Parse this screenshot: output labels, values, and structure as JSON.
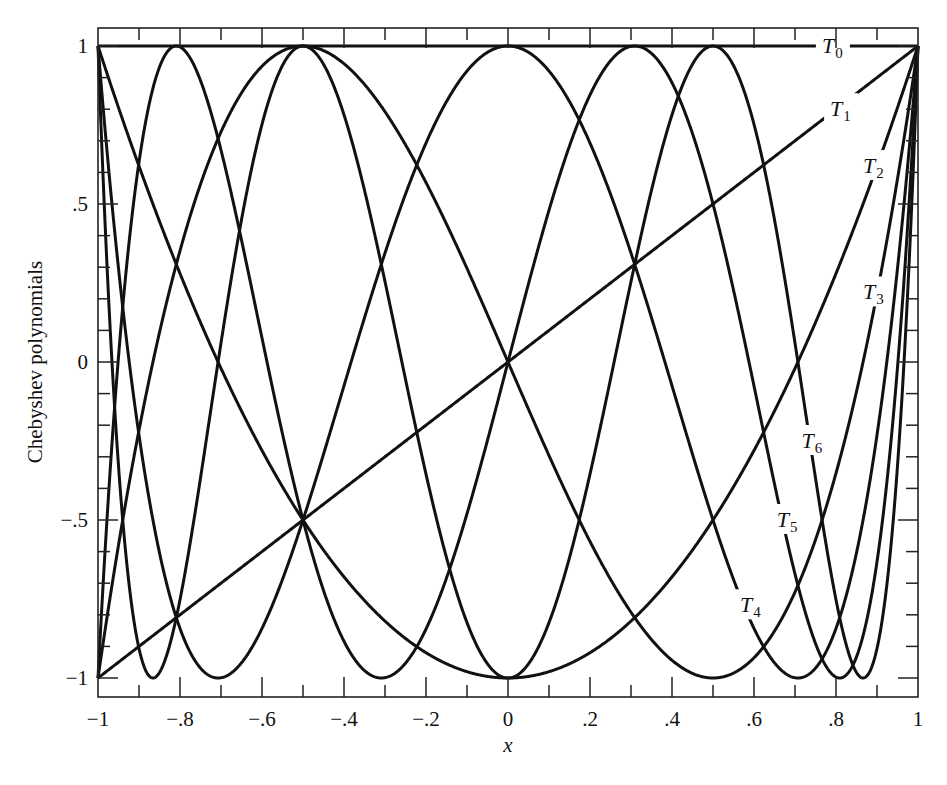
{
  "chart_data": {
    "type": "line",
    "title": "",
    "xlabel": "x",
    "ylabel": "Chebyshev polynomials",
    "xlim": [
      -1,
      1
    ],
    "ylim": [
      -1,
      1
    ],
    "grid": false,
    "legend": "inline labels",
    "x_ticks": [
      -1,
      -0.8,
      -0.6,
      -0.4,
      -0.2,
      0,
      0.2,
      0.4,
      0.6,
      0.8,
      1
    ],
    "x_tick_labels": [
      "−1",
      "−.8",
      "−.6",
      "−.4",
      "−.2",
      "0",
      ".2",
      ".4",
      ".6",
      ".8",
      "1"
    ],
    "y_ticks": [
      1,
      0.5,
      0,
      -0.5,
      -1
    ],
    "y_tick_labels": [
      "1",
      ".5",
      "0",
      "−.5",
      "−1"
    ],
    "series": [
      {
        "name": "T0",
        "order": 0,
        "formula": "cos(0*acos(x))",
        "values_at_x_ticks": [
          1,
          1,
          1,
          1,
          1,
          1,
          1,
          1,
          1,
          1,
          1
        ]
      },
      {
        "name": "T1",
        "order": 1,
        "formula": "x",
        "values_at_x_ticks": [
          -1,
          -0.8,
          -0.6,
          -0.4,
          -0.2,
          0,
          0.2,
          0.4,
          0.6,
          0.8,
          1
        ]
      },
      {
        "name": "T2",
        "order": 2,
        "formula": "2x^2-1",
        "values_at_x_ticks": [
          1,
          0.28,
          -0.28,
          -0.68,
          -0.92,
          -1,
          -0.92,
          -0.68,
          -0.28,
          0.28,
          1
        ]
      },
      {
        "name": "T3",
        "order": 3,
        "formula": "4x^3-3x",
        "values_at_x_ticks": [
          -1,
          0.352,
          0.936,
          0.944,
          0.568,
          0,
          -0.568,
          -0.944,
          -0.936,
          -0.352,
          1
        ]
      },
      {
        "name": "T4",
        "order": 4,
        "formula": "8x^4-8x^2+1",
        "values_at_x_ticks": [
          1,
          -0.843,
          -0.846,
          0.005,
          0.693,
          1,
          0.693,
          0.005,
          -0.846,
          -0.843,
          1
        ]
      },
      {
        "name": "T5",
        "order": 5,
        "formula": "16x^5-20x^3+5x",
        "values_at_x_ticks": [
          -1,
          -0.999,
          0.078,
          0.946,
          -0.845,
          0,
          0.845,
          -0.946,
          -0.078,
          0.999,
          1
        ]
      },
      {
        "name": "T6",
        "order": 6,
        "formula": "32x^6-48x^4+18x^2-1",
        "values_at_x_ticks": [
          1,
          0.443,
          0.939,
          -0.751,
          -0.126,
          -1,
          -0.126,
          -0.751,
          0.939,
          0.443,
          1
        ]
      }
    ],
    "labels": [
      {
        "series": "T0",
        "text": "T",
        "sub": "0",
        "x": 0.79,
        "y": 1.0
      },
      {
        "series": "T1",
        "text": "T",
        "sub": "1",
        "x": 0.81,
        "y": 0.8
      },
      {
        "series": "T2",
        "text": "T",
        "sub": "2",
        "x": 0.89,
        "y": 0.62
      },
      {
        "series": "T3",
        "text": "T",
        "sub": "3",
        "x": 0.89,
        "y": 0.22
      },
      {
        "series": "T4",
        "text": "T",
        "sub": "4",
        "x": 0.59,
        "y": -0.77
      },
      {
        "series": "T5",
        "text": "T",
        "sub": "5",
        "x": 0.68,
        "y": -0.5
      },
      {
        "series": "T6",
        "text": "T",
        "sub": "6",
        "x": 0.74,
        "y": -0.25
      }
    ]
  },
  "plot": {
    "frame": {
      "left": 98,
      "right": 918,
      "top": 28,
      "bottom": 697
    },
    "data_px": {
      "x_min": 98,
      "x_max": 918,
      "y_top": 46,
      "y_bottom": 678
    },
    "line_color": "#111111",
    "background": "#ffffff"
  }
}
